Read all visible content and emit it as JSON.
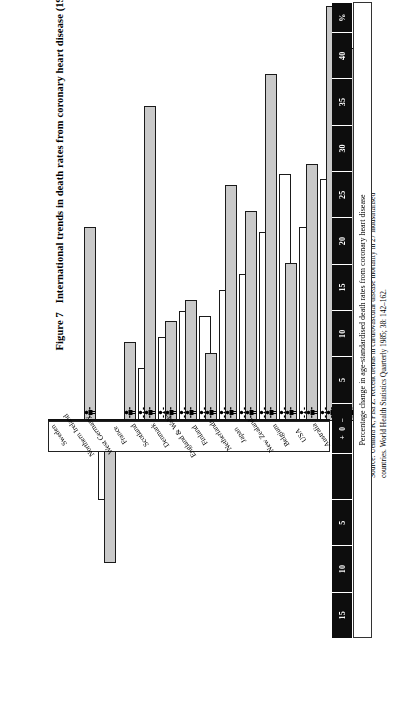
{
  "figure": {
    "number": "Figure 7",
    "title": "International trends in death rates from coronary heart disease (1970/2–1980/2)"
  },
  "source": {
    "text": "Source: Uemura K, Pisa Z. Recent trends in cardiovascular disease mortality in 27 industrialised countries. World Health Statistics Quarterly 1985; 38: 142–162."
  },
  "axis": {
    "caption": "Percentage change in age-standardised death rates from coronary heart disease",
    "cells": [
      "15",
      "10",
      "5",
      "",
      "+ 0 −",
      "5",
      "10",
      "15",
      "20",
      "25",
      "30",
      "35",
      "40",
      "%"
    ],
    "zero_label": "+ 0 −",
    "percent_label": "%"
  },
  "legend": {
    "male_icon": "male-figure-icon",
    "female_icon": "female-figure-icon",
    "male_fill": "#c9c9c9",
    "female_fill": "#ffffff"
  },
  "chart_data": {
    "type": "bar",
    "title": "International trends in death rates from coronary heart disease (1970/2–1980/2)",
    "xlabel": "Percentage change in age-standardised death rates from coronary heart disease",
    "ylabel": "",
    "orientation": "horizontal",
    "xlim": [
      -17,
      44
    ],
    "xticks": [
      -15,
      -10,
      -5,
      0,
      5,
      10,
      15,
      20,
      25,
      30,
      35,
      40
    ],
    "grid": false,
    "legend_position": "none",
    "note": "Positive values = percentage decrease in death rate; negative values = increase.",
    "categories": [
      "Sweden",
      "Northern Ireland",
      "West Germany",
      "France",
      "Scotland",
      "Denmark",
      "England & Wales",
      "Finland",
      "Netherlands",
      "Japan",
      "New Zealand",
      "Belgium",
      "USA",
      "Australia"
    ],
    "series": [
      {
        "name": "Male",
        "values": [
          18.5,
          -13.5,
          7.5,
          30.0,
          9.5,
          11.5,
          6.5,
          22.5,
          20.0,
          33.0,
          15.0,
          24.5,
          39.5,
          35.5
        ]
      },
      {
        "name": "Female",
        "values": [
          -7.5,
          -2.0,
          5.0,
          8.0,
          10.5,
          10.0,
          12.5,
          14.0,
          18.0,
          23.5,
          18.5,
          23.0,
          34.5,
          30.5
        ]
      }
    ]
  }
}
